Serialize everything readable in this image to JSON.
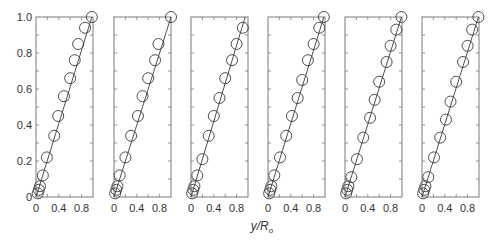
{
  "chart_data": {
    "type": "scatter",
    "layout": "6 side-by-side panels sharing y-axis",
    "xlabel": "y/R",
    "xlabel_subscript": "o",
    "ylabel": "",
    "xlim": [
      0,
      1.0
    ],
    "ylim": [
      0,
      1.0
    ],
    "x_ticks": [
      "0",
      "0.4",
      "0.8"
    ],
    "y_ticks": [
      "0",
      "0.2",
      "0.4",
      "0.6",
      "0.8",
      "1.0"
    ],
    "grid": false,
    "legend": null,
    "marker": "open-circle",
    "fit_line": "straight line from origin through points",
    "panels": [
      {
        "name": "panel-1",
        "points": [
          [
            0.03,
            0.02
          ],
          [
            0.05,
            0.04
          ],
          [
            0.07,
            0.06
          ],
          [
            0.12,
            0.12
          ],
          [
            0.19,
            0.22
          ],
          [
            0.32,
            0.34
          ],
          [
            0.39,
            0.45
          ],
          [
            0.49,
            0.56
          ],
          [
            0.6,
            0.66
          ],
          [
            0.68,
            0.76
          ],
          [
            0.74,
            0.85
          ],
          [
            0.86,
            0.94
          ],
          [
            0.98,
            1.0
          ]
        ],
        "line": [
          [
            0,
            0
          ],
          [
            0.98,
            1.0
          ]
        ]
      },
      {
        "name": "panel-2",
        "points": [
          [
            0.02,
            0.02
          ],
          [
            0.04,
            0.04
          ],
          [
            0.06,
            0.06
          ],
          [
            0.1,
            0.12
          ],
          [
            0.2,
            0.22
          ],
          [
            0.3,
            0.34
          ],
          [
            0.42,
            0.45
          ],
          [
            0.5,
            0.56
          ],
          [
            0.6,
            0.66
          ],
          [
            0.72,
            0.76
          ],
          [
            0.78,
            0.85
          ],
          [
            1.0,
            1.0
          ]
        ],
        "line": [
          [
            0,
            0
          ],
          [
            1.0,
            1.0
          ]
        ]
      },
      {
        "name": "panel-3",
        "points": [
          [
            0.02,
            0.02
          ],
          [
            0.04,
            0.04
          ],
          [
            0.06,
            0.06
          ],
          [
            0.11,
            0.12
          ],
          [
            0.2,
            0.21
          ],
          [
            0.31,
            0.34
          ],
          [
            0.4,
            0.45
          ],
          [
            0.5,
            0.55
          ],
          [
            0.6,
            0.66
          ],
          [
            0.72,
            0.76
          ],
          [
            0.8,
            0.85
          ],
          [
            0.91,
            0.94
          ]
        ],
        "line": [
          [
            0,
            0
          ],
          [
            0.95,
            1.0
          ]
        ]
      },
      {
        "name": "panel-4",
        "points": [
          [
            0.02,
            0.02
          ],
          [
            0.04,
            0.04
          ],
          [
            0.06,
            0.06
          ],
          [
            0.11,
            0.12
          ],
          [
            0.21,
            0.22
          ],
          [
            0.32,
            0.34
          ],
          [
            0.42,
            0.45
          ],
          [
            0.52,
            0.55
          ],
          [
            0.6,
            0.65
          ],
          [
            0.7,
            0.76
          ],
          [
            0.8,
            0.85
          ],
          [
            0.9,
            0.94
          ],
          [
            0.98,
            1.0
          ]
        ],
        "line": [
          [
            0,
            0
          ],
          [
            0.98,
            1.0
          ]
        ]
      },
      {
        "name": "panel-5",
        "points": [
          [
            0.02,
            0.02
          ],
          [
            0.04,
            0.04
          ],
          [
            0.06,
            0.06
          ],
          [
            0.11,
            0.11
          ],
          [
            0.21,
            0.21
          ],
          [
            0.32,
            0.33
          ],
          [
            0.44,
            0.44
          ],
          [
            0.52,
            0.54
          ],
          [
            0.6,
            0.64
          ],
          [
            0.73,
            0.75
          ],
          [
            0.8,
            0.84
          ],
          [
            0.9,
            0.93
          ],
          [
            0.99,
            1.0
          ]
        ],
        "line": [
          [
            0,
            0
          ],
          [
            0.99,
            1.0
          ]
        ]
      },
      {
        "name": "panel-6",
        "points": [
          [
            0.02,
            0.02
          ],
          [
            0.04,
            0.04
          ],
          [
            0.06,
            0.06
          ],
          [
            0.11,
            0.11
          ],
          [
            0.21,
            0.22
          ],
          [
            0.32,
            0.33
          ],
          [
            0.42,
            0.43
          ],
          [
            0.5,
            0.53
          ],
          [
            0.6,
            0.64
          ],
          [
            0.72,
            0.75
          ],
          [
            0.8,
            0.84
          ],
          [
            0.88,
            0.93
          ],
          [
            0.99,
            1.0
          ]
        ],
        "line": [
          [
            0,
            0
          ],
          [
            0.99,
            1.0
          ]
        ]
      }
    ]
  },
  "colors": {
    "frame": "#7a7a7a",
    "marker": "#3a3a3a",
    "line": "#3a3a3a",
    "text": "#333333"
  }
}
